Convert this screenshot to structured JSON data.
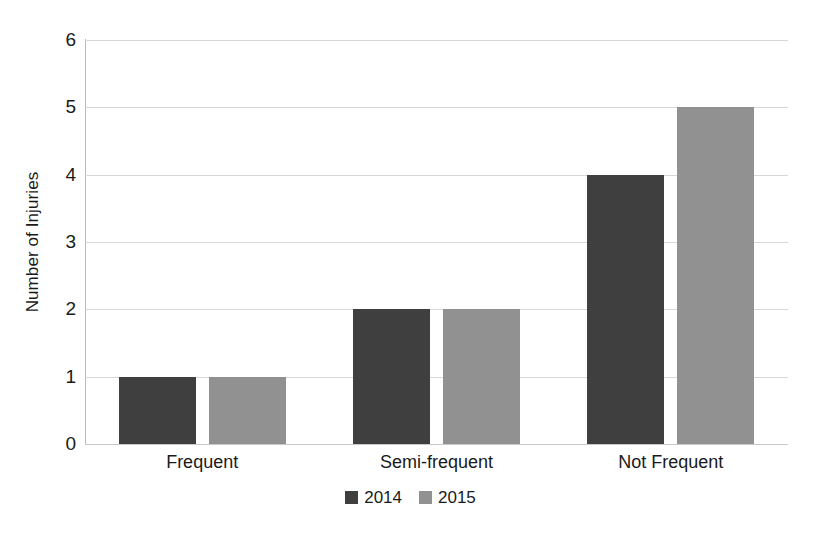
{
  "chart_data": {
    "type": "bar",
    "title": "",
    "xlabel": "",
    "ylabel": "Number of Injuries",
    "categories": [
      "Frequent",
      "Semi-frequent",
      "Not Frequent"
    ],
    "series": [
      {
        "name": "2014",
        "values": [
          1,
          2,
          4
        ],
        "color": "#3f3f3f"
      },
      {
        "name": "2015",
        "values": [
          1,
          2,
          5
        ],
        "color": "#919191"
      }
    ],
    "ylim": [
      0,
      6
    ],
    "yticks": [
      0,
      1,
      2,
      3,
      4,
      5,
      6
    ],
    "ytick_labels": [
      "0",
      "1",
      "2",
      "3",
      "4",
      "5",
      "6"
    ],
    "grid": true,
    "grid_axis": "y",
    "grid_color": "#d8d8d8",
    "legend_position": "bottom",
    "axis_line_color": "#b9b9b9",
    "background_color": "#ffffff",
    "text_color": "#1a1a1a"
  },
  "axis": {
    "y_title": "Number of Injuries"
  },
  "legend": {
    "entries": [
      {
        "label": "2014",
        "color": "#3f3f3f"
      },
      {
        "label": "2015",
        "color": "#919191"
      }
    ]
  }
}
